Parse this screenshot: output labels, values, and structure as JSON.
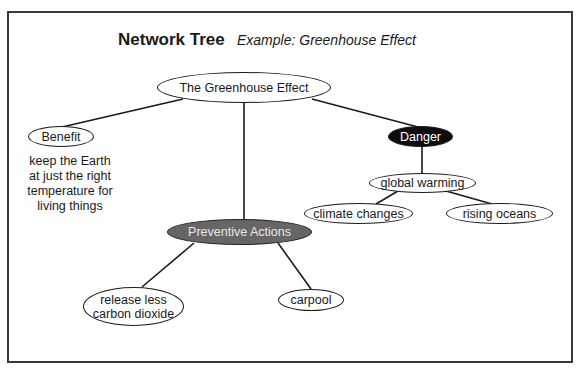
{
  "header": {
    "title": "Network Tree",
    "subtitle": "Example: Greenhouse Effect"
  },
  "nodes": {
    "root": {
      "label": "The Greenhouse Effect",
      "style": "plain"
    },
    "benefit": {
      "label": "Benefit",
      "style": "plain"
    },
    "danger": {
      "label": "Danger",
      "style": "dark",
      "fill": "#0d0d0d"
    },
    "preventive": {
      "label": "Preventive Actions",
      "style": "gray",
      "fill": "#666666"
    },
    "global_warming": {
      "label": "global warming",
      "style": "plain"
    },
    "climate_changes": {
      "label": "climate changes",
      "style": "plain"
    },
    "rising_oceans": {
      "label": "rising oceans",
      "style": "plain"
    },
    "release_less": {
      "label_line1": "release less",
      "label_line2": "carbon dioxide",
      "style": "plain"
    },
    "carpool": {
      "label": "carpool",
      "style": "plain"
    }
  },
  "benefit_note": {
    "lines": [
      "keep the Earth",
      "at just the right",
      "temperature for",
      "living things"
    ]
  },
  "edges": [
    [
      "root",
      "benefit"
    ],
    [
      "root",
      "danger"
    ],
    [
      "root",
      "preventive"
    ],
    [
      "danger",
      "global_warming"
    ],
    [
      "global_warming",
      "climate_changes"
    ],
    [
      "global_warming",
      "rising_oceans"
    ],
    [
      "preventive",
      "release_less"
    ],
    [
      "preventive",
      "carpool"
    ]
  ]
}
